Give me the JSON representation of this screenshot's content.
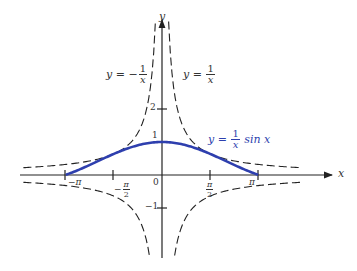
{
  "chart_data": {
    "type": "line",
    "title": "",
    "xlabel": "x",
    "ylabel": "y",
    "xlim": [
      -4.5,
      5.5
    ],
    "ylim": [
      -2.6,
      4.6
    ],
    "grid": false,
    "origin_px": [
      162,
      175
    ],
    "scale_px": {
      "x": 30.8,
      "y": 33
    },
    "x_ticks": [
      {
        "value": -3.14159,
        "label": "−π"
      },
      {
        "value": -1.5708,
        "label": "−π/2"
      },
      {
        "value": 0,
        "label": "0"
      },
      {
        "value": 1.5708,
        "label": "π/2"
      },
      {
        "value": 3.14159,
        "label": "π"
      }
    ],
    "y_ticks": [
      {
        "value": 2,
        "label": "2"
      },
      {
        "value": 1,
        "label": "1"
      },
      {
        "value": -1,
        "label": "−1"
      }
    ],
    "series": [
      {
        "name": "y = (1/x) sin x",
        "style": "solid",
        "color": "#2e3fae",
        "domain": [
          -3.14159,
          3.14159
        ]
      },
      {
        "name": "y = 1/x",
        "style": "dashed",
        "color": "#222222"
      },
      {
        "name": "y = −1/x",
        "style": "dashed",
        "color": "#222222"
      }
    ],
    "annotations": [
      {
        "text": "y = −1/x",
        "position": "upper-left"
      },
      {
        "text": "y = 1/x",
        "position": "upper-right"
      },
      {
        "text": "y = (1/x) sin x",
        "position": "right of peak",
        "color": "#2e3fae"
      }
    ]
  },
  "labels": {
    "x_axis": "x",
    "y_axis": "y",
    "neg_recip": {
      "lhs": "y =",
      "sign": "−",
      "num": "1",
      "den": "x"
    },
    "recip": {
      "lhs": "y =",
      "num": "1",
      "den": "x"
    },
    "sinc": {
      "lhs": "y =",
      "num": "1",
      "den": "x",
      "rhs": "sin x"
    },
    "tick_neg_pi": "−π",
    "tick_pi": "π",
    "tick_neg_half_pi_num": "π",
    "tick_neg_half_pi_den": "2",
    "tick_neg_sign": "−",
    "tick_half_pi_num": "π",
    "tick_half_pi_den": "2",
    "tick_zero": "0",
    "tick_y2": "2",
    "tick_y1": "1",
    "tick_ym1": "−1"
  }
}
